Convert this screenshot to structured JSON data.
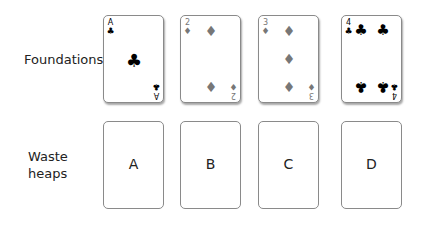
{
  "rows": {
    "foundations_label": "Foundations",
    "waste_label_line1": "Waste",
    "waste_label_line2": "heaps"
  },
  "foundations": [
    {
      "rank": "A",
      "suit": "clubs",
      "suit_glyph": "♣"
    },
    {
      "rank": "2",
      "suit": "diamonds",
      "suit_glyph": "♦"
    },
    {
      "rank": "3",
      "suit": "diamonds",
      "suit_glyph": "♦"
    },
    {
      "rank": "4",
      "suit": "clubs",
      "suit_glyph": "♣"
    }
  ],
  "waste_heaps": [
    {
      "label": "A"
    },
    {
      "label": "B"
    },
    {
      "label": "C"
    },
    {
      "label": "D"
    }
  ],
  "colors": {
    "clubs": "#000000",
    "diamonds": "#777777",
    "card_border": "#8a8a8a"
  }
}
